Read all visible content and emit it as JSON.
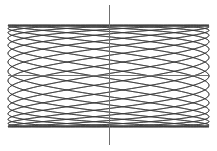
{
  "figure": {
    "background_color": "#ffffff",
    "curve_color": "#3a3a3a",
    "axis_color": "#707070",
    "curve_stroke_width": 0.75,
    "axis_stroke_width": 1
  },
  "chart_data": {
    "type": "line",
    "subtitle": "",
    "xlabel": "",
    "ylabel": "",
    "grid": false,
    "legend": "none",
    "axes": {
      "show_x_axis": true,
      "show_y_axis": true,
      "origin_px": {
        "x": 109,
        "y": 75.5
      },
      "x_axis_extent_px": {
        "x1": 8,
        "x2": 209,
        "y": 75.5
      },
      "y_axis_extent_px": {
        "x": 109,
        "y1": 5,
        "y2": 145
      },
      "xlim": [
        -1,
        1
      ],
      "ylim": [
        -1,
        1
      ]
    },
    "parametric": {
      "equation_x": "A * sin(a * t + delta)",
      "equation_y": "B * sin(b * t)",
      "A": 100.5,
      "B": 51,
      "a": 17,
      "b": 5.5,
      "delta": 1.5707963,
      "t_min": 0,
      "t_max": 12.56637,
      "samples": 4000,
      "center_x_px": 108.5,
      "center_y_px": 76,
      "bounding_box_px": {
        "left": 8,
        "top": 25,
        "right": 209,
        "bottom": 127
      },
      "horizontal_lobes": 17,
      "vertical_lobes": 5.5
    },
    "categories": [],
    "values": [],
    "series": [
      {
        "name": "lissajous-curve",
        "description": "Dense woven lattice formed by x=A*sin(17t+pi/2), y=B*sin(5.5t)",
        "color": "#3a3a3a"
      }
    ],
    "annotations": []
  }
}
